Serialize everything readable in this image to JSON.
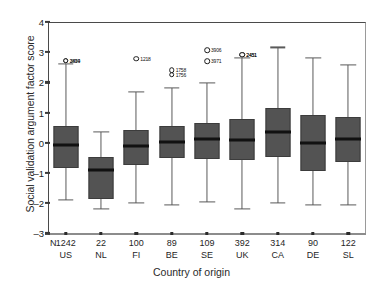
{
  "chart_data": {
    "type": "box",
    "title": "",
    "xlabel": "Country of origin",
    "ylabel": "Social validation argument factor score",
    "ylim": [
      -3,
      4
    ],
    "yticks": [
      4,
      3,
      2,
      1,
      0,
      -1,
      -2,
      -3
    ],
    "grid": false,
    "legend": "none",
    "n_row_label": "N",
    "categories": [
      "US",
      "NL",
      "FI",
      "BE",
      "SE",
      "UK",
      "CA",
      "DE",
      "SL"
    ],
    "n_values": [
      "1242",
      "22",
      "100",
      "89",
      "109",
      "392",
      "314",
      "90",
      "122"
    ],
    "boxes": [
      {
        "country": "US",
        "n": "1242",
        "whisker_low": -1.9,
        "q1": -0.82,
        "median": -0.07,
        "q3": 0.55,
        "whisker_high": 2.62,
        "outliers": [
          {
            "value": 2.72,
            "label": "3494"
          },
          {
            "value": 2.72,
            "label": "2839"
          }
        ]
      },
      {
        "country": "NL",
        "n": "22",
        "whisker_low": -2.2,
        "q1": -1.87,
        "median": -0.9,
        "q3": -0.47,
        "whisker_high": 0.35,
        "outliers": []
      },
      {
        "country": "FI",
        "n": "100",
        "whisker_low": -2.0,
        "q1": -0.72,
        "median": -0.1,
        "q3": 0.44,
        "whisker_high": 1.68,
        "outliers": [
          {
            "value": 2.79,
            "label": "1218"
          }
        ]
      },
      {
        "country": "BE",
        "n": "89",
        "whisker_low": -2.05,
        "q1": -0.5,
        "median": 0.02,
        "q3": 0.55,
        "whisker_high": 1.83,
        "outliers": [
          {
            "value": 2.4,
            "label": "1758"
          },
          {
            "value": 2.26,
            "label": "1756"
          }
        ]
      },
      {
        "country": "SE",
        "n": "109",
        "whisker_low": -1.95,
        "q1": -0.55,
        "median": 0.14,
        "q3": 0.64,
        "whisker_high": 1.98,
        "outliers": [
          {
            "value": 3.07,
            "label": "3906"
          },
          {
            "value": 2.7,
            "label": "3971"
          }
        ]
      },
      {
        "country": "UK",
        "n": "392",
        "whisker_low": -2.18,
        "q1": -0.58,
        "median": 0.1,
        "q3": 0.79,
        "whisker_high": 2.82,
        "outliers": [
          {
            "value": 2.92,
            "label": "2431"
          },
          {
            "value": 2.92,
            "label": "2451"
          }
        ]
      },
      {
        "country": "CA",
        "n": "314",
        "whisker_low": -2.0,
        "q1": -0.47,
        "median": 0.36,
        "q3": 1.16,
        "whisker_high": 3.16,
        "outliers": []
      },
      {
        "country": "DE",
        "n": "90",
        "whisker_low": -2.05,
        "q1": -0.93,
        "median": 0.0,
        "q3": 0.92,
        "whisker_high": 2.82,
        "outliers": []
      },
      {
        "country": "SL",
        "n": "122",
        "whisker_low": -2.05,
        "q1": -0.65,
        "median": 0.12,
        "q3": 0.85,
        "whisker_high": 2.58,
        "outliers": []
      }
    ],
    "colors": {
      "box_fill": "#535353",
      "box_edge": "#3c3c3c",
      "median": "#111111",
      "whisker": "#5a5a5a",
      "outlier_edge": "#1a1a1a",
      "axis": "#4a4a4a",
      "background": "#ffffff"
    }
  }
}
